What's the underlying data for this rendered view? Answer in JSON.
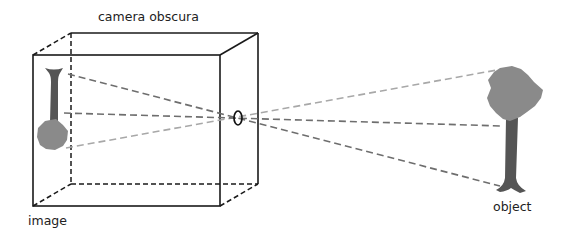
{
  "labels": {
    "title": "camera obscura",
    "image": "image",
    "object": "object"
  },
  "colors": {
    "box_stroke": "#1a1a1a",
    "ray_dark": "#6e6e6e",
    "ray_light": "#a8a8a8",
    "crown_fill": "#8a8a8a",
    "trunk_fill": "#555555",
    "pinhole_stroke": "#111111"
  },
  "geometry": {
    "box_front": {
      "x1": 33,
      "y1": 55,
      "x2": 220,
      "y2": 206
    },
    "box_back": {
      "x1": 71,
      "y1": 33,
      "x2": 258,
      "y2": 184
    },
    "pinhole": {
      "cx": 238,
      "cy": 118,
      "rx": 4,
      "ry": 7
    },
    "rays": [
      {
        "name": "ray-crown",
        "from": [
          66,
          148
        ],
        "to": [
          497,
          70
        ],
        "tone": "light"
      },
      {
        "name": "ray-middle",
        "from": [
          64,
          113
        ],
        "to": [
          502,
          126
        ],
        "tone": "dark"
      },
      {
        "name": "ray-base",
        "from": [
          68,
          74
        ],
        "to": [
          500,
          186
        ],
        "tone": "dark"
      }
    ]
  }
}
